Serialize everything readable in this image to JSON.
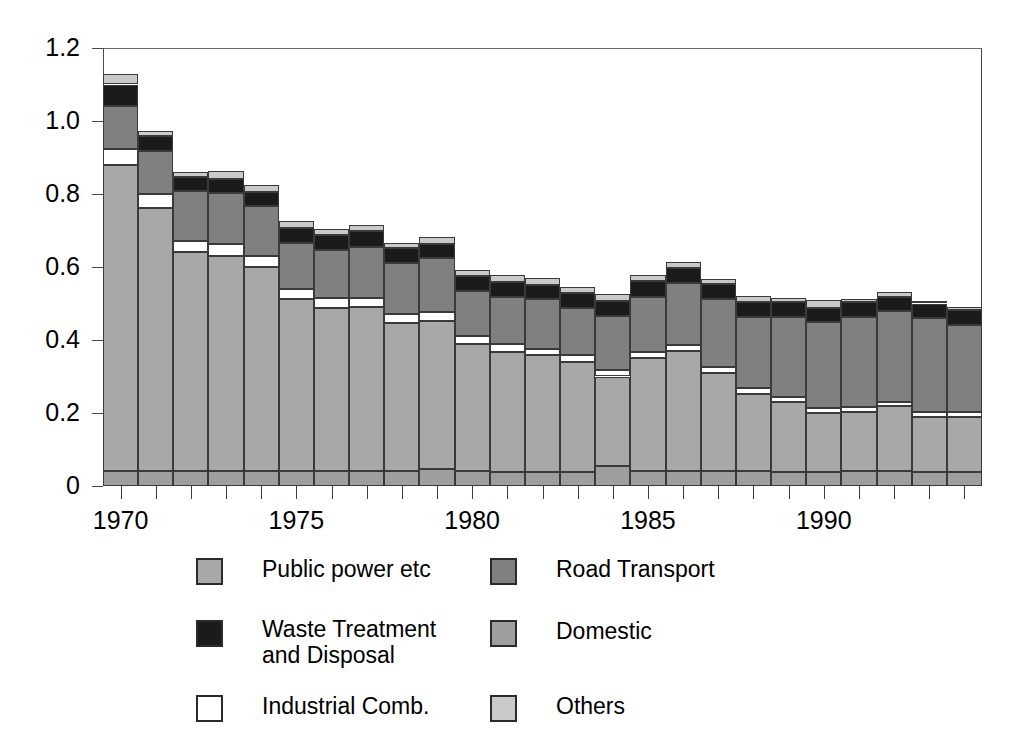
{
  "chart_data": {
    "type": "bar",
    "subtype": "stacked-bar",
    "title": "",
    "xlabel": "",
    "ylabel": "",
    "ylim": [
      0,
      1.2
    ],
    "ytick_values": [
      0,
      0.2,
      0.4,
      0.6,
      0.8,
      1.0,
      1.2
    ],
    "ytick_labels": [
      "0",
      "0.2",
      "0.4",
      "0.6",
      "0.8",
      "1.0",
      "1.2"
    ],
    "grid": false,
    "legend_position": "below",
    "xlim": [
      1969.5,
      1994.5
    ],
    "categories": [
      1970,
      1971,
      1972,
      1973,
      1974,
      1975,
      1976,
      1977,
      1978,
      1979,
      1980,
      1981,
      1982,
      1983,
      1984,
      1985,
      1986,
      1987,
      1988,
      1989,
      1990,
      1991,
      1992,
      1993,
      1994
    ],
    "xtick_labels": [
      "1970",
      "1975",
      "1980",
      "1985",
      "1990"
    ],
    "xtick_label_years": [
      1970,
      1975,
      1980,
      1985,
      1990
    ],
    "stack_order_bottom_to_top": [
      "Domestic",
      "Public power etc",
      "Industrial Comb.",
      "Road Transport",
      "Waste Treatment and Disposal",
      "Others"
    ],
    "series": [
      {
        "name": "Domestic",
        "color": "#9e9e9e",
        "values": [
          0.04,
          0.04,
          0.04,
          0.04,
          0.04,
          0.04,
          0.042,
          0.042,
          0.042,
          0.047,
          0.042,
          0.038,
          0.038,
          0.038,
          0.055,
          0.042,
          0.04,
          0.04,
          0.04,
          0.038,
          0.038,
          0.04,
          0.04,
          0.038,
          0.038
        ]
      },
      {
        "name": "Public power etc",
        "color": "#a8a8a8",
        "values": [
          0.84,
          0.722,
          0.6,
          0.59,
          0.56,
          0.472,
          0.446,
          0.448,
          0.405,
          0.405,
          0.348,
          0.33,
          0.32,
          0.302,
          0.245,
          0.308,
          0.33,
          0.27,
          0.212,
          0.192,
          0.162,
          0.162,
          0.178,
          0.152,
          0.152
        ]
      },
      {
        "name": "Industrial Comb.",
        "color": "#ffffff",
        "values": [
          0.042,
          0.038,
          0.032,
          0.032,
          0.03,
          0.028,
          0.026,
          0.026,
          0.024,
          0.024,
          0.022,
          0.02,
          0.018,
          0.018,
          0.017,
          0.017,
          0.017,
          0.016,
          0.016,
          0.015,
          0.014,
          0.014,
          0.013,
          0.012,
          0.012
        ]
      },
      {
        "name": "Road Transport",
        "color": "#808080",
        "values": [
          0.118,
          0.118,
          0.136,
          0.142,
          0.136,
          0.126,
          0.132,
          0.14,
          0.14,
          0.148,
          0.122,
          0.13,
          0.136,
          0.13,
          0.148,
          0.152,
          0.168,
          0.185,
          0.195,
          0.218,
          0.235,
          0.248,
          0.248,
          0.258,
          0.24
        ]
      },
      {
        "name": "Waste Treatment and Disposal",
        "color": "#1b1b1b",
        "values": [
          0.06,
          0.042,
          0.038,
          0.038,
          0.04,
          0.042,
          0.042,
          0.042,
          0.04,
          0.04,
          0.04,
          0.042,
          0.04,
          0.04,
          0.042,
          0.042,
          0.042,
          0.042,
          0.042,
          0.04,
          0.04,
          0.04,
          0.04,
          0.04,
          0.04
        ]
      },
      {
        "name": "Others",
        "color": "#c9c9c9",
        "values": [
          0.03,
          0.012,
          0.014,
          0.02,
          0.018,
          0.018,
          0.016,
          0.016,
          0.016,
          0.018,
          0.018,
          0.018,
          0.018,
          0.018,
          0.018,
          0.018,
          0.016,
          0.014,
          0.016,
          0.012,
          0.02,
          0.008,
          0.012,
          0.006,
          0.008
        ]
      }
    ],
    "totals": [
      1.13,
      0.972,
      0.86,
      0.862,
      0.824,
      0.726,
      0.704,
      0.714,
      0.667,
      0.682,
      0.592,
      0.578,
      0.57,
      0.546,
      0.525,
      0.579,
      0.613,
      0.567,
      0.521,
      0.515,
      0.509,
      0.512,
      0.531,
      0.506,
      0.49
    ]
  },
  "legend": {
    "items": [
      {
        "label": "Public power etc",
        "color": "#a8a8a8",
        "fill": "fill-public",
        "col": 0,
        "row": 0
      },
      {
        "label": "Waste Treatment\nand Disposal",
        "color": "#1b1b1b",
        "fill": "fill-waste",
        "col": 0,
        "row": 1
      },
      {
        "label": "Industrial Comb.",
        "color": "#ffffff",
        "fill": "fill-industrial",
        "col": 0,
        "row": 2
      },
      {
        "label": "Road Transport",
        "color": "#808080",
        "fill": "fill-road",
        "col": 1,
        "row": 0
      },
      {
        "label": "Domestic",
        "color": "#9e9e9e",
        "fill": "fill-domestic",
        "col": 1,
        "row": 1
      },
      {
        "label": "Others",
        "color": "#c9c9c9",
        "fill": "fill-others",
        "col": 1,
        "row": 2
      }
    ]
  },
  "axis": {
    "frame_color": "#4a4a4a",
    "tick_color": "#3c3c3c"
  }
}
